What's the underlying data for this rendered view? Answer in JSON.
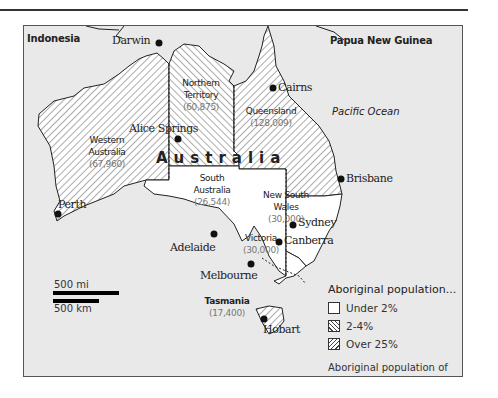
{
  "map": {
    "title": "Australia",
    "neighbors": {
      "indonesia": "Indonesia",
      "png": "Papua New Guinea"
    },
    "ocean": "Pacific Ocean",
    "states": [
      {
        "name_line1": "Western",
        "name_line2": "Australia",
        "population": "(67,960)",
        "category": "2-4%"
      },
      {
        "name_line1": "Northern",
        "name_line2": "Territory",
        "population": "(60,875)",
        "category": "Over 25%"
      },
      {
        "name_line1": "Queensland",
        "name_line2": "",
        "population": "(128,009)",
        "category": "2-4%"
      },
      {
        "name_line1": "South",
        "name_line2": "Australia",
        "population": "(26,544)",
        "category": "Under 2%"
      },
      {
        "name_line1": "New South",
        "name_line2": "Wales",
        "population": "(30,000)",
        "category": "Under 2%"
      },
      {
        "name_line1": "Victoria",
        "name_line2": "",
        "population": "(30,000)",
        "category": "Under 2%"
      },
      {
        "name_line1": "Tasmania",
        "name_line2": "",
        "population": "(17,400)",
        "category": "2-4%"
      }
    ],
    "cities": {
      "darwin": "Darwin",
      "cairns": "Cairns",
      "alice_springs": "Alice Springs",
      "brisbane": "Brisbane",
      "perth": "Perth",
      "sydney": "Sydney",
      "canberra": "Canberra",
      "adelaide": "Adelaide",
      "melbourne": "Melbourne",
      "hobart": "Hobart"
    },
    "scale": {
      "miles": "500 mi",
      "km": "500 km"
    },
    "legend": {
      "title": "Aboriginal population...",
      "items": [
        {
          "label": "Under 2%",
          "pattern": "none"
        },
        {
          "label": "2-4%",
          "pattern": "backslash-hatch"
        },
        {
          "label": "Over 25%",
          "pattern": "slash-hatch"
        }
      ],
      "note": "Aboriginal population of states in brackets."
    },
    "colors": {
      "sea": "#e9e9e9",
      "land": "#ffffff",
      "ink": "#222222"
    }
  }
}
